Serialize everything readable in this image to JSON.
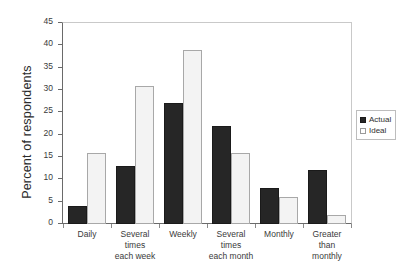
{
  "chart_data": {
    "type": "bar",
    "title": "",
    "xlabel": "",
    "ylabel": "Percent of respondents",
    "ylim": [
      0,
      45
    ],
    "ytick_step": 5,
    "yticks": [
      45,
      40,
      35,
      30,
      25,
      20,
      15,
      10,
      5,
      0
    ],
    "grid": false,
    "legend_position": "right",
    "categories": [
      "Daily",
      "Several times each week",
      "Weekly",
      "Several times each month",
      "Monthly",
      "Greater than monthly"
    ],
    "category_lines": [
      [
        "Daily"
      ],
      [
        "Several times",
        "each week"
      ],
      [
        "Weekly"
      ],
      [
        "Several times",
        "each month"
      ],
      [
        "Monthly"
      ],
      [
        "Greater than",
        "monthly"
      ]
    ],
    "series": [
      {
        "name": "Actual",
        "color": "#262626",
        "values": [
          4,
          13,
          27,
          22,
          8,
          12
        ]
      },
      {
        "name": "Ideal",
        "color": "#f3f3f3",
        "values": [
          16,
          31,
          39,
          16,
          6,
          2
        ]
      }
    ]
  },
  "legend": {
    "entries": [
      {
        "label": "Actual",
        "swatch": "filled-square-icon"
      },
      {
        "label": "Ideal",
        "swatch": "empty-square-icon"
      }
    ]
  },
  "axis": {
    "y_title": "Percent of respondents"
  }
}
